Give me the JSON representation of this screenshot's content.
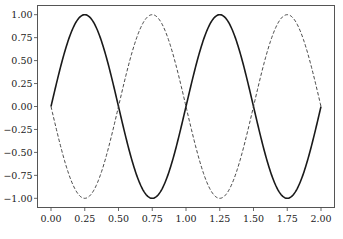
{
  "chart_data": {
    "type": "line",
    "title": "",
    "xlabel": "",
    "ylabel": "",
    "xlim": [
      -0.1,
      2.1
    ],
    "ylim": [
      -1.1,
      1.1
    ],
    "grid": false,
    "legend": null,
    "x_ticks": [
      0.0,
      0.25,
      0.5,
      0.75,
      1.0,
      1.25,
      1.5,
      1.75,
      2.0
    ],
    "x_tick_labels": [
      "0.00",
      "0.25",
      "0.50",
      "0.75",
      "1.00",
      "1.25",
      "1.50",
      "1.75",
      "2.00"
    ],
    "y_ticks": [
      1.0,
      0.75,
      0.5,
      0.25,
      0.0,
      -0.25,
      -0.5,
      -0.75,
      -1.0
    ],
    "y_tick_labels": [
      "1.00",
      "0.75",
      "0.50",
      "0.25",
      "0.00",
      "−0.25",
      "−0.50",
      "−0.75",
      "−1.00"
    ],
    "series": [
      {
        "name": "sin(2πx)",
        "style": "solid",
        "color": "#1a1a1a",
        "function": "sin(2*pi*x)",
        "x_range": [
          0,
          2
        ],
        "key_points": [
          [
            0,
            0
          ],
          [
            0.25,
            1
          ],
          [
            0.5,
            0
          ],
          [
            0.75,
            -1
          ],
          [
            1.0,
            0
          ],
          [
            1.25,
            1
          ],
          [
            1.5,
            0
          ],
          [
            1.75,
            -1
          ],
          [
            2.0,
            0
          ]
        ]
      },
      {
        "name": "-sin(2πx)",
        "style": "dashed",
        "color": "#333333",
        "function": "-sin(2*pi*x)",
        "x_range": [
          0,
          2
        ],
        "key_points": [
          [
            0,
            0
          ],
          [
            0.25,
            -1
          ],
          [
            0.5,
            0
          ],
          [
            0.75,
            1
          ],
          [
            1.0,
            0
          ],
          [
            1.25,
            -1
          ],
          [
            1.5,
            0
          ],
          [
            1.75,
            1
          ],
          [
            2.0,
            0
          ]
        ]
      }
    ]
  }
}
